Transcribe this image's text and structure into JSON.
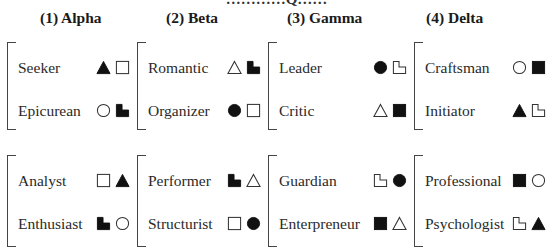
{
  "top_caption": "…………Q……",
  "columns": [
    {
      "header": "(1) Alpha",
      "groups": [
        [
          {
            "label": "Seeker",
            "symbols": [
              "triangle-filled",
              "square-outline"
            ]
          },
          {
            "label": "Epicurean",
            "symbols": [
              "circle-outline",
              "step-filled"
            ]
          }
        ],
        [
          {
            "label": "Analyst",
            "symbols": [
              "square-outline",
              "triangle-filled"
            ]
          },
          {
            "label": "Enthusiast",
            "symbols": [
              "step-filled",
              "circle-outline"
            ]
          }
        ]
      ]
    },
    {
      "header": "(2) Beta",
      "groups": [
        [
          {
            "label": "Romantic",
            "symbols": [
              "triangle-outline",
              "step-filled"
            ]
          },
          {
            "label": "Organizer",
            "symbols": [
              "circle-filled",
              "square-outline"
            ]
          }
        ],
        [
          {
            "label": "Performer",
            "symbols": [
              "step-filled",
              "triangle-outline"
            ]
          },
          {
            "label": "Structurist",
            "symbols": [
              "square-outline",
              "circle-filled"
            ]
          }
        ]
      ]
    },
    {
      "header": "(3) Gamma",
      "groups": [
        [
          {
            "label": "Leader",
            "symbols": [
              "circle-filled",
              "step-outline"
            ]
          },
          {
            "label": "Critic",
            "symbols": [
              "triangle-outline",
              "square-filled"
            ]
          }
        ],
        [
          {
            "label": "Guardian",
            "symbols": [
              "step-outline",
              "circle-filled"
            ]
          },
          {
            "label": "Enterpreneur",
            "symbols": [
              "square-filled",
              "triangle-outline"
            ]
          }
        ]
      ]
    },
    {
      "header": "(4) Delta",
      "groups": [
        [
          {
            "label": "Craftsman",
            "symbols": [
              "circle-outline",
              "square-filled"
            ]
          },
          {
            "label": "Initiator",
            "symbols": [
              "triangle-filled",
              "step-outline"
            ]
          }
        ],
        [
          {
            "label": "Professional",
            "symbols": [
              "square-filled",
              "circle-outline"
            ]
          },
          {
            "label": "Psychologist",
            "symbols": [
              "step-outline",
              "triangle-filled"
            ]
          }
        ]
      ]
    }
  ],
  "colors": {
    "ink": "#111111",
    "line": "#444444"
  }
}
